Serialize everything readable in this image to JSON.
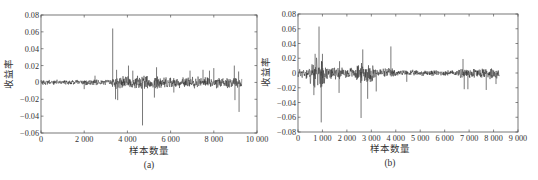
{
  "chart_data": [
    {
      "id": "a",
      "type": "line",
      "caption": "(a)",
      "title": "",
      "xlabel": "样本数量",
      "ylabel": "收益率",
      "xlim": [
        0,
        10000
      ],
      "ylim": [
        -0.06,
        0.08
      ],
      "xticks": [
        0,
        2000,
        4000,
        6000,
        8000,
        10000
      ],
      "xtick_labels": [
        "0",
        "2 000",
        "4 000",
        "6 000",
        "8 000",
        "10 000"
      ],
      "yticks": [
        0.08,
        0.06,
        0.04,
        0.02,
        0,
        -0.02,
        -0.04,
        -0.06
      ],
      "ytick_labels": [
        "0.08",
        "0.06",
        "0.04",
        "0.02",
        "0",
        "−0.02",
        "−0.04",
        "−0.06"
      ],
      "grid": false,
      "legend": null,
      "n_samples": 9300,
      "series": [
        {
          "name": "收益率",
          "description": "Return series oscillating around 0; low volatility before ~3 300, higher afterwards",
          "volatility_segments": [
            {
              "x_start": 0,
              "x_end": 3300,
              "amplitude": 0.0025
            },
            {
              "x_start": 3300,
              "x_end": 5500,
              "amplitude": 0.006
            },
            {
              "x_start": 5500,
              "x_end": 9300,
              "amplitude": 0.005
            }
          ],
          "spikes": [
            {
              "x": 3320,
              "y": 0.064
            },
            {
              "x": 3500,
              "y": 0.015
            },
            {
              "x": 3450,
              "y": -0.02
            },
            {
              "x": 3550,
              "y": -0.021
            },
            {
              "x": 4050,
              "y": 0.02
            },
            {
              "x": 4250,
              "y": 0.014
            },
            {
              "x": 4700,
              "y": -0.051
            },
            {
              "x": 5250,
              "y": -0.018
            },
            {
              "x": 5350,
              "y": 0.018
            },
            {
              "x": 6150,
              "y": -0.012
            },
            {
              "x": 6900,
              "y": 0.014
            },
            {
              "x": 7500,
              "y": 0.015
            },
            {
              "x": 7800,
              "y": 0.014
            },
            {
              "x": 8000,
              "y": 0.017
            },
            {
              "x": 8950,
              "y": 0.02
            },
            {
              "x": 8980,
              "y": -0.021
            },
            {
              "x": 9150,
              "y": 0.013
            },
            {
              "x": 9170,
              "y": -0.035
            },
            {
              "x": 2000,
              "y": -0.008
            },
            {
              "x": 2500,
              "y": 0.008
            }
          ]
        }
      ]
    },
    {
      "id": "b",
      "type": "line",
      "caption": "(b)",
      "title": "",
      "xlabel": "样本数量",
      "ylabel": "收益率",
      "xlim": [
        0,
        9000
      ],
      "ylim": [
        -0.08,
        0.08
      ],
      "xticks": [
        0,
        1000,
        2000,
        3000,
        4000,
        5000,
        6000,
        7000,
        8000,
        9000
      ],
      "xtick_labels": [
        "0",
        "1 000",
        "2 000",
        "3 000",
        "4 000",
        "5 000",
        "6 000",
        "7 000",
        "8 000",
        "9 000"
      ],
      "yticks": [
        0.08,
        0.06,
        0.04,
        0.02,
        0,
        -0.02,
        -0.04,
        -0.06,
        -0.08
      ],
      "ytick_labels": [
        "0.08",
        "0.06",
        "0.04",
        "0.02",
        "0",
        "−0.02",
        "−0.04",
        "−0.06",
        "−0.08"
      ],
      "grid": false,
      "legend": null,
      "n_samples": 8250,
      "series": [
        {
          "name": "收益率",
          "description": "Return series around 0; high volatility clusters near 500-1 100 and 2 500-3 000, calmer 4 000-6 500",
          "volatility_segments": [
            {
              "x_start": 0,
              "x_end": 500,
              "amplitude": 0.006
            },
            {
              "x_start": 500,
              "x_end": 1100,
              "amplitude": 0.014
            },
            {
              "x_start": 1100,
              "x_end": 2400,
              "amplitude": 0.006
            },
            {
              "x_start": 2400,
              "x_end": 3100,
              "amplitude": 0.01
            },
            {
              "x_start": 3100,
              "x_end": 4000,
              "amplitude": 0.005
            },
            {
              "x_start": 4000,
              "x_end": 6600,
              "amplitude": 0.003
            },
            {
              "x_start": 6600,
              "x_end": 8250,
              "amplitude": 0.006
            }
          ],
          "spikes": [
            {
              "x": 860,
              "y": 0.063
            },
            {
              "x": 950,
              "y": -0.067
            },
            {
              "x": 650,
              "y": -0.03
            },
            {
              "x": 700,
              "y": 0.026
            },
            {
              "x": 1000,
              "y": 0.026
            },
            {
              "x": 1700,
              "y": 0.016
            },
            {
              "x": 1680,
              "y": -0.027
            },
            {
              "x": 2580,
              "y": -0.061
            },
            {
              "x": 2650,
              "y": 0.032
            },
            {
              "x": 2850,
              "y": -0.035
            },
            {
              "x": 3200,
              "y": -0.025
            },
            {
              "x": 3800,
              "y": 0.036
            },
            {
              "x": 4450,
              "y": -0.012
            },
            {
              "x": 6750,
              "y": 0.019
            },
            {
              "x": 6800,
              "y": -0.022
            },
            {
              "x": 6950,
              "y": -0.022
            },
            {
              "x": 7700,
              "y": -0.023
            },
            {
              "x": 8100,
              "y": -0.015
            }
          ]
        }
      ]
    }
  ]
}
